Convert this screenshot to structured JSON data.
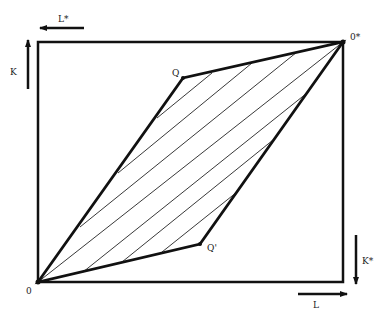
{
  "diagram": {
    "type": "edgeworth-box",
    "colors": {
      "ink": "#111111",
      "background": "#ffffff"
    },
    "box": {
      "x1": 38,
      "y1": 42,
      "x2": 346,
      "y2": 282
    },
    "origins": {
      "home": {
        "label": "0",
        "x": 38,
        "y": 282
      },
      "foreign": {
        "label": "0*",
        "x": 343,
        "y": 42
      }
    },
    "points": {
      "Q": {
        "label": "Q",
        "x": 183,
        "y": 78
      },
      "Q_prime": {
        "label": "Q'",
        "x": 200,
        "y": 244
      }
    },
    "axis_labels": {
      "L": "L",
      "K": "K",
      "L_star": "L*",
      "K_star": "K*"
    },
    "hatch_lines": [
      {
        "x1": 157,
        "y1": 118,
        "x2": 212,
        "y2": 73
      },
      {
        "x1": 118,
        "y1": 173,
        "x2": 252,
        "y2": 63
      },
      {
        "x1": 80,
        "y1": 227,
        "x2": 297,
        "y2": 52
      },
      {
        "x1": 38,
        "y1": 282,
        "x2": 343,
        "y2": 42
      },
      {
        "x1": 83,
        "y1": 272,
        "x2": 307,
        "y2": 93
      },
      {
        "x1": 122,
        "y1": 262,
        "x2": 273,
        "y2": 140
      },
      {
        "x1": 162,
        "y1": 252,
        "x2": 237,
        "y2": 192
      }
    ]
  }
}
